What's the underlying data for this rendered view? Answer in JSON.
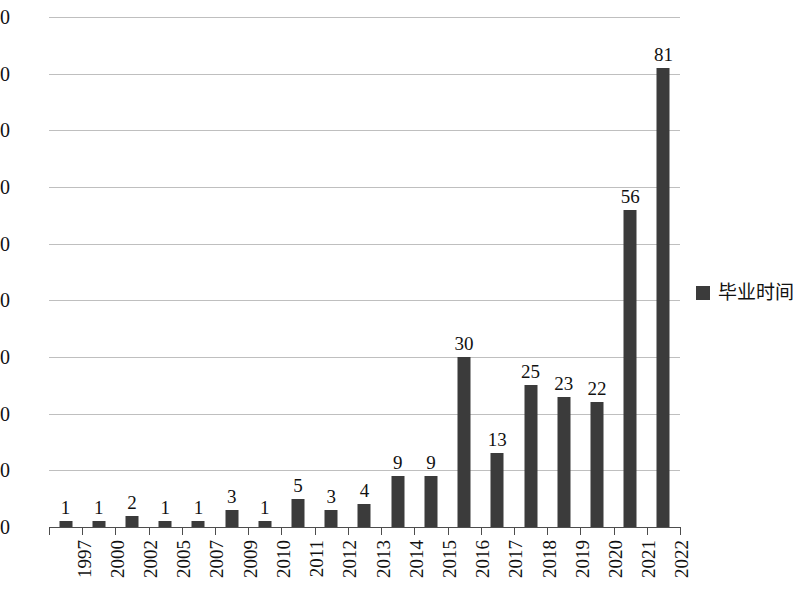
{
  "chart_data": {
    "type": "bar",
    "title": "",
    "xlabel": "",
    "ylabel": "",
    "ylim": [
      0,
      90
    ],
    "ytick_step": 10,
    "yticks": [
      0,
      10,
      20,
      30,
      40,
      50,
      60,
      70,
      80,
      90
    ],
    "grid": true,
    "legend_position": "right",
    "legend": [
      "毕业时间"
    ],
    "bar_color": "#3b3b3b",
    "gridline_color": "#bfbfbf",
    "axis_color": "#4d4d4d",
    "categories": [
      "1997",
      "2000",
      "2002",
      "2005",
      "2007",
      "2009",
      "2010",
      "2011",
      "2012",
      "2013",
      "2014",
      "2015",
      "2016",
      "2017",
      "2018",
      "2019",
      "2020",
      "2021",
      "2022"
    ],
    "series": [
      {
        "name": "毕业时间",
        "values": [
          1,
          1,
          2,
          1,
          1,
          3,
          1,
          5,
          3,
          4,
          9,
          9,
          30,
          13,
          25,
          23,
          22,
          56,
          81
        ]
      }
    ],
    "data_labels": [
      "1",
      "1",
      "2",
      "1",
      "1",
      "3",
      "1",
      "5",
      "3",
      "4",
      "9",
      "9",
      "30",
      "13",
      "25",
      "23",
      "22",
      "56",
      "81"
    ]
  },
  "legend": {
    "series_label": "毕业时间"
  }
}
